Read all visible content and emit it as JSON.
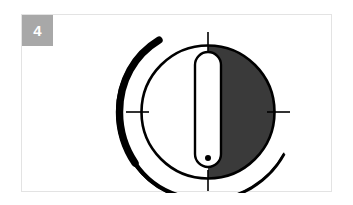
{
  "figure": {
    "number_label": "4",
    "badge_color": "#a8a8a8",
    "card_background": "#ffffff",
    "card_border_color": "#e3e3e3",
    "page_background": "#ffffff"
  },
  "illustration": {
    "name": "control-dial-diagram",
    "description": "Rotary control dial shown with right half shaded dark and a capsule shaped pointer at the vertical position",
    "colors": {
      "shaded_half": "#3a3a3a",
      "outline": "#000000",
      "dial_face": "#ffffff",
      "pointer_fill": "#ffffff",
      "pointer_outline": "#000000",
      "rotation_arc": "#000000",
      "tick_mark": "#000000"
    },
    "dial": {
      "center_x": 186,
      "center_y": 97,
      "radius": 68,
      "shaded_side": "right",
      "outline_width": 3
    },
    "pointer": {
      "shape": "capsule",
      "orientation": "vertical",
      "center_x": 186,
      "top_y": 37,
      "bottom_y": 152,
      "width": 26,
      "outline_width": 2.5,
      "indicator_dot": {
        "x": 186,
        "y": 143,
        "radius": 3
      }
    },
    "tick_marks": [
      {
        "name": "tick-top",
        "position": "12-oclock",
        "angle_degrees": 90
      },
      {
        "name": "tick-left",
        "position": "9-oclock",
        "angle_degrees": 180
      },
      {
        "name": "tick-right",
        "position": "3-oclock",
        "angle_degrees": 0
      },
      {
        "name": "tick-bottom",
        "position": "6-oclock",
        "angle_degrees": 270
      }
    ],
    "rotation_arc": {
      "name": "rotation-direction-arc",
      "start_position": "upper-left",
      "end_position": "right",
      "sweep": "counter-clockwise-from-top-left-through-bottom",
      "thick_end": "upper-left",
      "thin_end": "right"
    }
  }
}
